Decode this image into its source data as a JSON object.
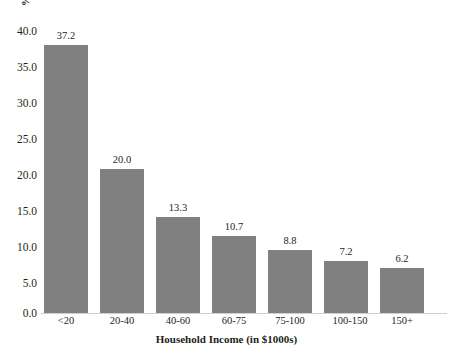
{
  "chart_data": {
    "type": "bar",
    "title": "",
    "subtitle": "",
    "xlabel": "Household Income (in $1000s)",
    "ylabel": "%",
    "categories": [
      "<20",
      "20-40",
      "40-60",
      "60-75",
      "75-100",
      "100-150",
      "150+"
    ],
    "values": [
      37.2,
      20.0,
      13.3,
      10.7,
      8.8,
      7.2,
      6.2
    ],
    "value_labels": [
      "37.2",
      "20.0",
      "13.3",
      "10.7",
      "8.8",
      "7.2",
      "6.2"
    ],
    "ylim": [
      0.0,
      40.0
    ],
    "ytick_step": 5.0,
    "ytick_labels": [
      "40.0",
      "35.0",
      "30.0",
      "25.0",
      "20.0",
      "15.0",
      "10.0",
      "5.0",
      "0.0"
    ],
    "ytick_values": [
      40.0,
      35.0,
      30.0,
      25.0,
      20.0,
      15.0,
      10.0,
      5.0,
      0.0
    ],
    "grid": false,
    "legend": false,
    "legend_position": "none",
    "bar_color": "#808080",
    "background_color": "#ffffff",
    "axis_line_color": "#cfcfcf",
    "text_color": "#231f20"
  }
}
